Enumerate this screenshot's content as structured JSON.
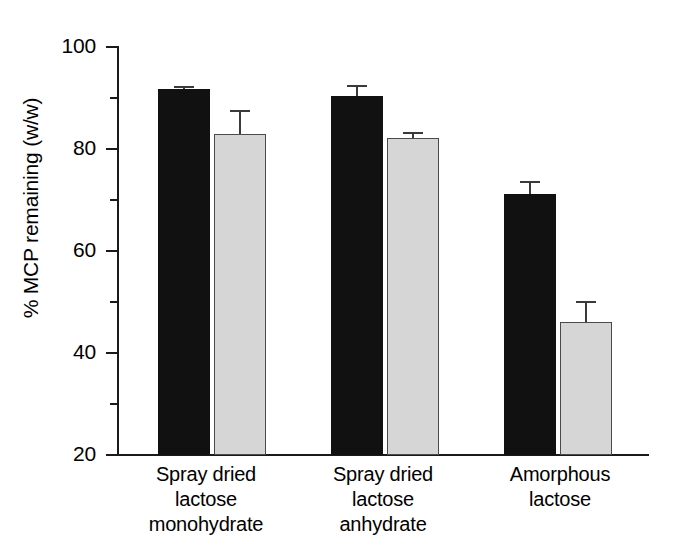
{
  "chart_data": {
    "type": "bar",
    "title": "",
    "xlabel": "",
    "ylabel": "% MCP remaining (w/w)",
    "ylim": [
      20,
      100
    ],
    "ytick_values": [
      20,
      40,
      60,
      80,
      100
    ],
    "ytick_labels": [
      "20",
      "40",
      "60",
      "80",
      "100"
    ],
    "yminor_ticks": [
      30,
      50,
      70,
      90
    ],
    "grid": false,
    "legend": "none",
    "categories": [
      "Spray dried\nlactose\nmonohydrate",
      "Spray dried\nlactose\nanhydrate",
      "Amorphous\nlactose"
    ],
    "category_lines": [
      [
        "Spray dried",
        "lactose",
        "monohydrate"
      ],
      [
        "Spray dried",
        "lactose",
        "anhydrate"
      ],
      [
        "Amorphous",
        "lactose"
      ]
    ],
    "series": [
      {
        "name": "black-series",
        "color": "#111111",
        "values": [
          91.5,
          90.3,
          71.0
        ],
        "errors": [
          0.6,
          2.0,
          2.6
        ]
      },
      {
        "name": "grey-series",
        "color": "#d6d6d6",
        "values": [
          82.8,
          82.0,
          46.0
        ],
        "errors": [
          4.6,
          1.1,
          4.2
        ]
      }
    ]
  },
  "axis": {
    "y_title": "% MCP remaining (w/w)",
    "y_labels": [
      "100",
      "80",
      "60",
      "40",
      "20"
    ]
  },
  "categories": {
    "g1": {
      "l1": "Spray dried",
      "l2": "lactose",
      "l3": "monohydrate"
    },
    "g2": {
      "l1": "Spray dried",
      "l2": "lactose",
      "l3": "anhydrate"
    },
    "g3": {
      "l1": "Amorphous",
      "l2": "lactose",
      "l3": ""
    }
  }
}
